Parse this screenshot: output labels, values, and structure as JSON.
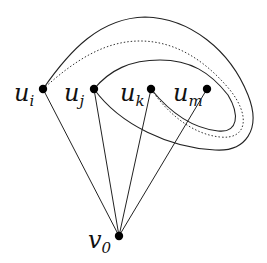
{
  "diagram": {
    "nodes": [
      {
        "id": "u_i",
        "base": "u",
        "sub": "i",
        "x": 43,
        "y": 89,
        "label_x": 14,
        "label_y": 101
      },
      {
        "id": "u_j",
        "base": "u",
        "sub": "j",
        "x": 94,
        "y": 89,
        "label_x": 64,
        "label_y": 101
      },
      {
        "id": "u_k",
        "base": "u",
        "sub": "k",
        "x": 151,
        "y": 89,
        "label_x": 120,
        "label_y": 101
      },
      {
        "id": "u_m",
        "base": "u",
        "sub": "m",
        "x": 207,
        "y": 89,
        "label_x": 173,
        "label_y": 101
      },
      {
        "id": "v_0",
        "base": "v",
        "sub": "0",
        "x": 119,
        "y": 236,
        "label_x": 88,
        "label_y": 248
      }
    ],
    "edges": [
      {
        "from": "u_i",
        "to": "v_0"
      },
      {
        "from": "u_j",
        "to": "v_0"
      },
      {
        "from": "u_k",
        "to": "v_0"
      },
      {
        "from": "u_m",
        "to": "v_0"
      }
    ],
    "curves": [
      {
        "name": "outer-curve",
        "from": "u_i",
        "to": "u_j",
        "style": "solid"
      },
      {
        "name": "inner-curve",
        "from": "u_j",
        "to": "u_k",
        "style": "solid"
      },
      {
        "name": "dotted-curve",
        "from": "u_i",
        "to": "u_k",
        "style": "dotted"
      }
    ],
    "colors": {
      "stroke": "#222222",
      "node": "#000000",
      "background": "#ffffff"
    }
  }
}
